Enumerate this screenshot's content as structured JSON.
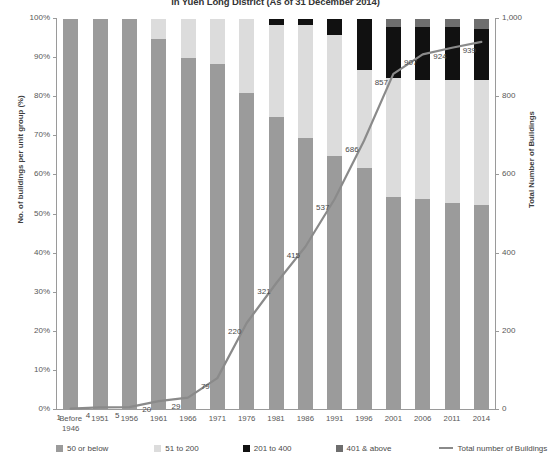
{
  "title": "in Yuen Long District (As of 31 December 2014)",
  "axes": {
    "left_title": "No. of buildings per unit group (%)",
    "right_title": "Total Number of Buildings",
    "left_ticks": [
      "0%",
      "10%",
      "20%",
      "30%",
      "40%",
      "50%",
      "60%",
      "70%",
      "80%",
      "90%",
      "100%"
    ],
    "right_ticks": [
      "0",
      "200",
      "400",
      "600",
      "800",
      "1,000"
    ]
  },
  "legend": {
    "items": [
      {
        "label": "50 or below",
        "color": "#9b9b9b",
        "type": "swatch"
      },
      {
        "label": "51 to 200",
        "color": "#dcdcdc",
        "type": "swatch"
      },
      {
        "label": "201 to 400",
        "color": "#111111",
        "type": "swatch"
      },
      {
        "label": "401 & above",
        "color": "#6e6e6e",
        "type": "swatch"
      },
      {
        "label": "Total number of Buildings",
        "color": "#8a8a8a",
        "type": "line"
      }
    ]
  },
  "chart_data": {
    "type": "bar",
    "title": "in Yuen Long District (As of 31 December 2014)",
    "xlabel": "",
    "ylabel": "No. of buildings per unit group (%)",
    "y2label": "Total Number of Buildings",
    "ylim": [
      0,
      100
    ],
    "y2lim": [
      0,
      1000
    ],
    "grid": false,
    "legend_position": "bottom",
    "categories": [
      "Before 1946",
      "1951",
      "1956",
      "1961",
      "1966",
      "1971",
      "1976",
      "1981",
      "1986",
      "1991",
      "1996",
      "2001",
      "2006",
      "2011",
      "2014"
    ],
    "series": [
      {
        "name": "50 or below",
        "color": "#9b9b9b",
        "values": [
          100,
          100,
          100,
          95,
          90,
          88.5,
          81,
          75,
          69.5,
          65,
          62,
          54.5,
          54,
          53,
          52.5
        ]
      },
      {
        "name": "51 to 200",
        "color": "#dcdcdc",
        "values": [
          0,
          0,
          0,
          5,
          10,
          11.5,
          19,
          23.5,
          29,
          31,
          25,
          30.5,
          30.5,
          31.5,
          32
        ]
      },
      {
        "name": "201 to 400",
        "color": "#111111",
        "values": [
          0,
          0,
          0,
          0,
          0,
          0,
          0,
          1.5,
          1.5,
          4,
          13,
          13,
          13.5,
          13.5,
          13
        ]
      },
      {
        "name": "401 & above",
        "color": "#6e6e6e",
        "values": [
          0,
          0,
          0,
          0,
          0,
          0,
          0,
          0,
          0,
          0,
          0,
          2,
          2,
          2,
          2.5
        ]
      }
    ],
    "line_series": {
      "name": "Total number of Buildings",
      "color": "#8a8a8a",
      "axis": "y2",
      "values": [
        1,
        4,
        5,
        20,
        29,
        79,
        220,
        321,
        415,
        537,
        686,
        857,
        907,
        924,
        939
      ]
    }
  }
}
